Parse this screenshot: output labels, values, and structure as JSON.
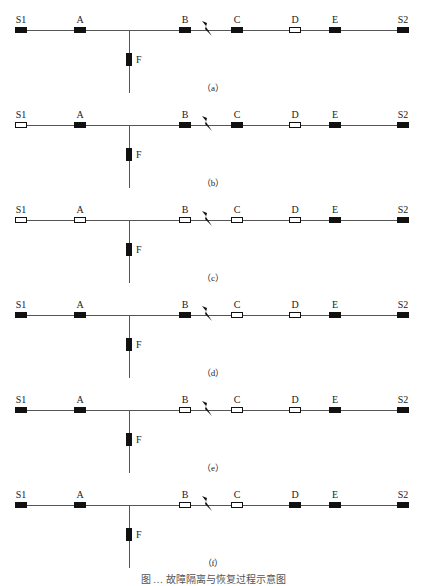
{
  "figure": {
    "caption": "图 … 故障隔离与恢复过程示意图",
    "switch_positions": {
      "S1": 21,
      "A": 80,
      "B": 185,
      "C": 237,
      "D": 295,
      "E": 335,
      "S2": 403
    },
    "colors": {
      "closed": "#111111",
      "open": "#ffffff",
      "line": "#555555"
    },
    "panels": [
      {
        "label": "（a）",
        "top": 0,
        "states": {
          "S1": "closed",
          "A": "closed",
          "B": "closed",
          "C": "closed",
          "D": "open",
          "E": "closed",
          "S2": "closed",
          "F": "closed"
        }
      },
      {
        "label": "（b）",
        "top": 95,
        "states": {
          "S1": "open",
          "A": "closed",
          "B": "closed",
          "C": "closed",
          "D": "open",
          "E": "closed",
          "S2": "closed",
          "F": "closed"
        }
      },
      {
        "label": "（c）",
        "top": 190,
        "states": {
          "S1": "open",
          "A": "open",
          "B": "open",
          "C": "open",
          "D": "open",
          "E": "closed",
          "S2": "closed",
          "F": "closed"
        }
      },
      {
        "label": "（d）",
        "top": 285,
        "states": {
          "S1": "closed",
          "A": "closed",
          "B": "closed",
          "C": "open",
          "D": "open",
          "E": "closed",
          "S2": "closed",
          "F": "closed"
        }
      },
      {
        "label": "（e）",
        "top": 380,
        "states": {
          "S1": "closed",
          "A": "closed",
          "B": "open",
          "C": "open",
          "D": "open",
          "E": "closed",
          "S2": "closed",
          "F": "closed"
        }
      },
      {
        "label": "（f）",
        "top": 475,
        "states": {
          "S1": "closed",
          "A": "closed",
          "B": "open",
          "C": "open",
          "D": "closed",
          "E": "closed",
          "S2": "closed",
          "F": "closed"
        }
      }
    ],
    "switch_labels": [
      "S1",
      "A",
      "B",
      "C",
      "D",
      "E",
      "S2"
    ],
    "branch_label": "F",
    "fault_icon": "lightning-bolt-icon"
  }
}
